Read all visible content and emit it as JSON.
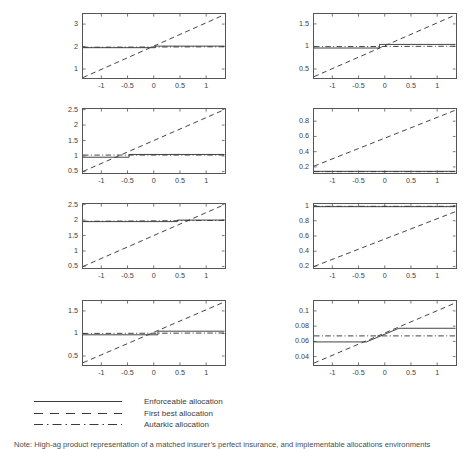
{
  "figure": {
    "title": "",
    "caption": "Note: High-ag product representation of a matched insurer’s perfect insurance, and implementable allocations environments",
    "legend": {
      "position": "bottom-left",
      "entries": [
        {
          "label": "Enforceable allocation",
          "style": "solid"
        },
        {
          "label": "First best allocation",
          "style": "dashed"
        },
        {
          "label": "Autarkic allocation",
          "style": "dashdot"
        }
      ]
    }
  },
  "chart_data": [
    {
      "id": "panel-r1c1",
      "type": "line",
      "title": "",
      "xlabel": "",
      "ylabel": "",
      "grid": false,
      "xlim": [
        -1.35,
        1.35
      ],
      "ylim": [
        0.6,
        3.45
      ],
      "xticks": [
        -1,
        -0.5,
        0,
        0.5,
        1
      ],
      "xticklabels": [
        "-1",
        "-0.5",
        "0",
        "0.5",
        "1"
      ],
      "yticks": [
        1,
        2,
        3
      ],
      "yticklabels": [
        "1",
        "2",
        "3"
      ],
      "series": [
        {
          "name": "Enforceable allocation",
          "style": "solid",
          "x": [
            -1.35,
            0.03,
            0.03,
            1.35
          ],
          "y": [
            1.95,
            1.95,
            2.02,
            2.02
          ]
        },
        {
          "name": "First best allocation",
          "style": "dashed",
          "x": [
            -1.35,
            1.35
          ],
          "y": [
            0.62,
            3.42
          ]
        },
        {
          "name": "Autarkic allocation",
          "style": "dashdot",
          "x": [
            -1.35,
            1.35
          ],
          "y": [
            1.97,
            1.99
          ]
        }
      ]
    },
    {
      "id": "panel-r1c2",
      "type": "line",
      "title": "",
      "xlabel": "",
      "ylabel": "",
      "grid": false,
      "xlim": [
        -1.35,
        1.35
      ],
      "ylim": [
        0.3,
        1.72
      ],
      "xticks": [
        -1,
        -0.5,
        0,
        0.5,
        1
      ],
      "xticklabels": [
        "-1",
        "-0.5",
        "0",
        "0.5",
        "1"
      ],
      "yticks": [
        0.5,
        1,
        1.5
      ],
      "yticklabels": [
        "0.5",
        "1",
        "1.5"
      ],
      "series": [
        {
          "name": "Enforceable allocation",
          "style": "solid",
          "x": [
            -1.35,
            -0.1,
            -0.1,
            1.35
          ],
          "y": [
            0.965,
            0.965,
            1.045,
            1.045
          ]
        },
        {
          "name": "First best allocation",
          "style": "dashed",
          "x": [
            -1.35,
            1.35
          ],
          "y": [
            0.33,
            1.7
          ]
        },
        {
          "name": "Autarkic allocation",
          "style": "dashdot",
          "x": [
            -1.35,
            1.35
          ],
          "y": [
            0.995,
            1.005
          ]
        }
      ]
    },
    {
      "id": "panel-r2c1",
      "type": "line",
      "title": "",
      "xlabel": "",
      "ylabel": "",
      "grid": false,
      "xlim": [
        -1.35,
        1.35
      ],
      "ylim": [
        0.45,
        2.52
      ],
      "xticks": [
        -1,
        -0.5,
        0,
        0.5,
        1
      ],
      "xticklabels": [
        "-1",
        "-0.5",
        "0",
        "0.5",
        "1"
      ],
      "yticks": [
        0.5,
        1,
        1.5,
        2,
        2.5
      ],
      "yticklabels": [
        "0.5",
        "1",
        "1.5",
        "2",
        "2.5"
      ],
      "series": [
        {
          "name": "Enforceable allocation",
          "style": "solid",
          "x": [
            -1.35,
            -0.47,
            -0.47,
            1.35
          ],
          "y": [
            0.96,
            0.96,
            1.05,
            1.05
          ]
        },
        {
          "name": "First best allocation",
          "style": "dashed",
          "x": [
            -1.35,
            1.35
          ],
          "y": [
            0.5,
            2.5
          ]
        },
        {
          "name": "Autarkic allocation",
          "style": "dashdot",
          "x": [
            -1.35,
            1.35
          ],
          "y": [
            1.03,
            1.03
          ]
        }
      ]
    },
    {
      "id": "panel-r2c2",
      "type": "line",
      "title": "",
      "xlabel": "",
      "ylabel": "",
      "grid": false,
      "xlim": [
        -1.35,
        1.35
      ],
      "ylim": [
        0.12,
        0.96
      ],
      "xticks": [
        -1,
        -0.5,
        0,
        0.5,
        1
      ],
      "xticklabels": [
        "-1",
        "-0.5",
        "0",
        "0.5",
        "1"
      ],
      "yticks": [
        0.2,
        0.4,
        0.6,
        0.8
      ],
      "yticklabels": [
        "0.2",
        "0.4",
        "0.6",
        "0.8"
      ],
      "series": [
        {
          "name": "Enforceable allocation",
          "style": "solid",
          "x": [
            -1.35,
            1.35
          ],
          "y": [
            0.142,
            0.142
          ]
        },
        {
          "name": "First best allocation",
          "style": "dashed",
          "x": [
            -1.35,
            1.35
          ],
          "y": [
            0.21,
            0.945
          ]
        },
        {
          "name": "Autarkic allocation",
          "style": "dashdot",
          "x": [
            -1.35,
            1.35
          ],
          "y": [
            0.138,
            0.138
          ]
        }
      ]
    },
    {
      "id": "panel-r3c1",
      "type": "line",
      "title": "",
      "xlabel": "",
      "ylabel": "",
      "grid": false,
      "xlim": [
        -1.35,
        1.35
      ],
      "ylim": [
        0.45,
        2.52
      ],
      "xticks": [
        -1,
        -0.5,
        0,
        0.5,
        1
      ],
      "xticklabels": [
        "-1",
        "-0.5",
        "0",
        "0.5",
        "1"
      ],
      "yticks": [
        0.5,
        1,
        1.5,
        2,
        2.5
      ],
      "yticklabels": [
        "0.5",
        "1",
        "1.5",
        "2",
        "2.5"
      ],
      "series": [
        {
          "name": "Enforceable allocation",
          "style": "solid",
          "x": [
            -1.35,
            0.45,
            0.45,
            1.35
          ],
          "y": [
            1.95,
            1.95,
            2.0,
            2.0
          ]
        },
        {
          "name": "First best allocation",
          "style": "dashed",
          "x": [
            -1.35,
            1.35
          ],
          "y": [
            0.5,
            2.5
          ]
        },
        {
          "name": "Autarkic allocation",
          "style": "dashdot",
          "x": [
            -1.35,
            1.35
          ],
          "y": [
            1.96,
            1.99
          ]
        }
      ]
    },
    {
      "id": "panel-r3c2",
      "type": "line",
      "title": "",
      "xlabel": "",
      "ylabel": "",
      "grid": false,
      "xlim": [
        -1.35,
        1.35
      ],
      "ylim": [
        0.18,
        1.02
      ],
      "xticks": [
        -1,
        -0.5,
        0,
        0.5,
        1
      ],
      "xticklabels": [
        "-1",
        "-0.5",
        "0",
        "0.5",
        "1"
      ],
      "yticks": [
        0.2,
        0.4,
        0.6,
        0.8,
        1
      ],
      "yticklabels": [
        "0.2",
        "0.4",
        "0.6",
        "0.8",
        "1"
      ],
      "series": [
        {
          "name": "Enforceable allocation",
          "style": "solid",
          "x": [
            -1.35,
            1.35
          ],
          "y": [
            0.985,
            0.985
          ]
        },
        {
          "name": "First best allocation",
          "style": "dashed",
          "x": [
            -1.35,
            1.35
          ],
          "y": [
            0.2,
            0.92
          ]
        },
        {
          "name": "Autarkic allocation",
          "style": "dashdot",
          "x": [
            -1.35,
            1.35
          ],
          "y": [
            0.99,
            0.99
          ]
        }
      ]
    },
    {
      "id": "panel-r4c1",
      "type": "line",
      "title": "",
      "xlabel": "",
      "ylabel": "",
      "grid": false,
      "xlim": [
        -1.35,
        1.35
      ],
      "ylim": [
        0.3,
        1.72
      ],
      "xticks": [
        -1,
        -0.5,
        0,
        0.5,
        1
      ],
      "xticklabels": [
        "-1",
        "-0.5",
        "0",
        "0.5",
        "1"
      ],
      "yticks": [
        0.5,
        1,
        1.5
      ],
      "yticklabels": [
        "0.5",
        "1",
        "1.5"
      ],
      "series": [
        {
          "name": "Enforceable allocation",
          "style": "solid",
          "x": [
            -1.35,
            0.08,
            0.08,
            1.35
          ],
          "y": [
            0.97,
            0.97,
            1.05,
            1.05
          ]
        },
        {
          "name": "First best allocation",
          "style": "dashed",
          "x": [
            -1.35,
            1.35
          ],
          "y": [
            0.35,
            1.7
          ]
        },
        {
          "name": "Autarkic allocation",
          "style": "dashdot",
          "x": [
            -1.35,
            1.35
          ],
          "y": [
            1.0,
            1.01
          ]
        }
      ]
    },
    {
      "id": "panel-r4c2",
      "type": "line",
      "title": "",
      "xlabel": "",
      "ylabel": "",
      "grid": false,
      "xlim": [
        -1.35,
        1.35
      ],
      "ylim": [
        0.029,
        0.113
      ],
      "xticks": [
        -1,
        -0.5,
        0,
        0.5,
        1
      ],
      "xticklabels": [
        "-1",
        "-0.5",
        "0",
        "0.5",
        "1"
      ],
      "yticks": [
        0.04,
        0.06,
        0.08,
        0.1
      ],
      "yticklabels": [
        "0.04",
        "0.06",
        "0.08",
        "0.1"
      ],
      "series": [
        {
          "name": "Enforceable allocation",
          "style": "solid",
          "x": [
            -1.35,
            -0.35,
            0.27,
            1.35
          ],
          "y": [
            0.0593,
            0.0593,
            0.0772,
            0.0772
          ]
        },
        {
          "name": "First best allocation",
          "style": "dashed",
          "x": [
            -1.35,
            1.35
          ],
          "y": [
            0.0315,
            0.1105
          ]
        },
        {
          "name": "Autarkic allocation",
          "style": "dashdot",
          "x": [
            -1.35,
            1.35
          ],
          "y": [
            0.0672,
            0.0672
          ]
        }
      ]
    }
  ],
  "colors": {
    "axis": "#555555",
    "line": "#3a3a3a",
    "text": "#3d3d3d",
    "background": "#ffffff"
  }
}
